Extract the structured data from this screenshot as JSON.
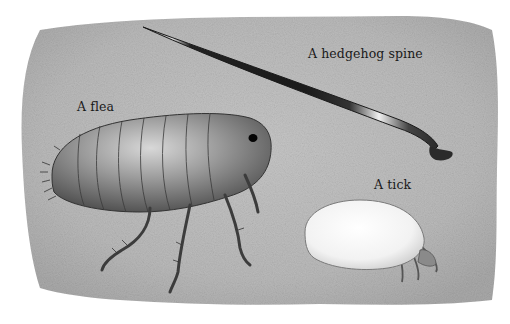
{
  "illustration": {
    "background_color": "#ffffff",
    "card_color": "#bdbdbd",
    "labels": {
      "spine": "A hedgehog spine",
      "flea": "A flea",
      "tick": "A tick"
    }
  }
}
